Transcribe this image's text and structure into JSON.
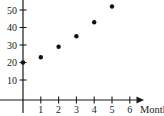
{
  "figure": {
    "background": "#ffffff",
    "axis_color": "#1a1a1a",
    "point_color": "#111111"
  },
  "chart_data": {
    "type": "scatter",
    "title": "",
    "xlabel": "Month",
    "ylabel": "",
    "x": [
      0,
      1,
      2,
      3,
      4,
      5
    ],
    "y": [
      20,
      23,
      29,
      35,
      43,
      52
    ],
    "x_tick_labels": [
      "1",
      "2",
      "3",
      "4",
      "5",
      "6"
    ],
    "y_tick_labels": [
      "10",
      "20",
      "30",
      "40",
      "50"
    ],
    "xlim": [
      0,
      6.8
    ],
    "ylim": [
      0,
      56
    ],
    "grid": false,
    "legend": false,
    "marker": "filled-circle",
    "x_axis_arrow": true
  }
}
